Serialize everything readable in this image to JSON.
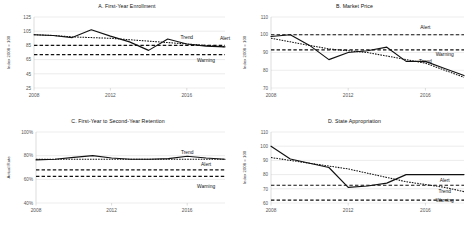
{
  "figure": {
    "panels": [
      "A",
      "B",
      "C",
      "D"
    ]
  },
  "chart_data": [
    {
      "id": "panel-a",
      "type": "line",
      "title": "A. First-Year Enrollment",
      "xlabel": "",
      "ylabel": "Index 2008 = 100",
      "x": [
        2008,
        2009,
        2010,
        2011,
        2012,
        2013,
        2014,
        2015,
        2016,
        2017,
        2018
      ],
      "xticks": [
        2008,
        2012,
        2016
      ],
      "yticks": [
        25,
        45,
        65,
        85,
        105,
        125
      ],
      "ylim": [
        25,
        125
      ],
      "grid": true,
      "legend": "inline-annotations",
      "series": [
        {
          "name": "Actual",
          "style": "solid",
          "values": [
            100,
            99,
            96,
            107,
            98,
            90,
            78,
            94,
            87,
            84,
            83
          ]
        },
        {
          "name": "Trend",
          "style": "dotted",
          "values": [
            100,
            99,
            97,
            96,
            95,
            93,
            91,
            89,
            87,
            85,
            83
          ]
        },
        {
          "name": "Alert",
          "style": "dashed",
          "values": [
            85,
            85,
            85,
            85,
            85,
            85,
            85,
            85,
            85,
            85,
            85
          ]
        },
        {
          "name": "Warning",
          "style": "dashed",
          "values": [
            72,
            72,
            72,
            72,
            72,
            72,
            72,
            72,
            72,
            72,
            72
          ]
        }
      ],
      "annotations": [
        {
          "label": "Trend",
          "x": 2016,
          "y": 94
        },
        {
          "label": "Alert",
          "x": 2018,
          "y": 92
        },
        {
          "label": "Warning",
          "x": 2017,
          "y": 61
        }
      ]
    },
    {
      "id": "panel-b",
      "type": "line",
      "title": "B. Market Price",
      "xlabel": "",
      "ylabel": "Index 2008 = 100",
      "x": [
        2008,
        2009,
        2010,
        2011,
        2012,
        2013,
        2014,
        2015,
        2016,
        2017,
        2018
      ],
      "xticks": [
        2008,
        2012,
        2016
      ],
      "yticks": [
        70,
        80,
        90,
        100,
        110
      ],
      "ylim": [
        70,
        110
      ],
      "grid": true,
      "legend": "inline-annotations",
      "series": [
        {
          "name": "Actual",
          "style": "solid",
          "values": [
            99,
            100,
            94,
            86,
            90,
            91,
            93,
            85,
            85,
            81,
            77
          ]
        },
        {
          "name": "Trend",
          "style": "dotted",
          "values": [
            98,
            96,
            94,
            92,
            91,
            90,
            88,
            86,
            84,
            80,
            76
          ]
        },
        {
          "name": "Alert",
          "style": "dashed",
          "values": [
            100,
            100,
            100,
            100,
            100,
            100,
            100,
            100,
            100,
            100,
            100
          ]
        },
        {
          "name": "Warning",
          "style": "dashed",
          "values": [
            91.5,
            91.5,
            91.5,
            91.5,
            91.5,
            91.5,
            91.5,
            91.5,
            91.5,
            91.5,
            91.5
          ]
        }
      ],
      "annotations": [
        {
          "label": "Alert",
          "x": 2016,
          "y": 103
        },
        {
          "label": "Warning",
          "x": 2017,
          "y": 88
        },
        {
          "label": "Trend",
          "x": 2016,
          "y": 84
        }
      ]
    },
    {
      "id": "panel-c",
      "type": "line",
      "title": "C. First-Year to Second-Year Retention",
      "xlabel": "",
      "ylabel": "Actual Rate",
      "x": [
        2008,
        2009,
        2010,
        2011,
        2012,
        2013,
        2014,
        2015,
        2016,
        2017,
        2018
      ],
      "xticks": [
        2008,
        2012,
        2016
      ],
      "yticks": [
        "40%",
        "60%",
        "80%",
        "100%"
      ],
      "ytickvalues": [
        40,
        60,
        80,
        100
      ],
      "ylim": [
        40,
        100
      ],
      "grid": true,
      "legend": "inline-annotations",
      "series": [
        {
          "name": "Actual",
          "style": "solid",
          "values": [
            76.5,
            77,
            78.5,
            80,
            78,
            77,
            77,
            77.5,
            79.5,
            78,
            77
          ]
        },
        {
          "name": "Trend",
          "style": "dotted",
          "values": [
            77,
            77,
            77,
            77,
            77,
            77,
            77,
            77,
            77,
            77,
            77
          ]
        },
        {
          "name": "Alert",
          "style": "dashed",
          "values": [
            68,
            68,
            68,
            68,
            68,
            68,
            68,
            68,
            68,
            68,
            68
          ]
        },
        {
          "name": "Warning",
          "style": "dashed",
          "values": [
            62.5,
            62.5,
            62.5,
            62.5,
            62.5,
            62.5,
            62.5,
            62.5,
            62.5,
            62.5,
            62.5
          ]
        }
      ],
      "annotations": [
        {
          "label": "Trend",
          "x": 2016,
          "y": 81
        },
        {
          "label": "Alert",
          "x": 2017,
          "y": 71
        },
        {
          "label": "Warning",
          "x": 2017,
          "y": 53
        }
      ]
    },
    {
      "id": "panel-d",
      "type": "line",
      "title": "D. State Appropriation",
      "xlabel": "",
      "ylabel": "Index 2008 = 100",
      "x": [
        2008,
        2009,
        2010,
        2011,
        2012,
        2013,
        2014,
        2015,
        2016,
        2017,
        2018
      ],
      "xticks": [
        2008,
        2012,
        2016
      ],
      "yticks": [
        60,
        70,
        80,
        90,
        100,
        110
      ],
      "ylim": [
        60,
        110
      ],
      "grid": true,
      "legend": "inline-annotations",
      "series": [
        {
          "name": "Actual",
          "style": "solid",
          "values": [
            100,
            91,
            88,
            85,
            71,
            72,
            74,
            80,
            80,
            80,
            80
          ]
        },
        {
          "name": "Trend",
          "style": "dotted",
          "values": [
            92,
            90,
            88,
            86,
            84,
            81,
            78,
            75,
            73,
            71,
            68
          ]
        },
        {
          "name": "Alert",
          "style": "dashed",
          "values": [
            72.5,
            72.5,
            72.5,
            72.5,
            72.5,
            72.5,
            72.5,
            72.5,
            72.5,
            72.5,
            72.5
          ]
        },
        {
          "name": "Warning",
          "style": "dashed",
          "values": [
            62,
            62,
            62,
            62,
            62,
            62,
            62,
            62,
            62,
            62,
            62
          ]
        }
      ],
      "annotations": [
        {
          "label": "Alert",
          "x": 2017,
          "y": 75
        },
        {
          "label": "Trend",
          "x": 2017,
          "y": 67
        },
        {
          "label": "Warning",
          "x": 2017,
          "y": 60.5
        }
      ]
    }
  ]
}
